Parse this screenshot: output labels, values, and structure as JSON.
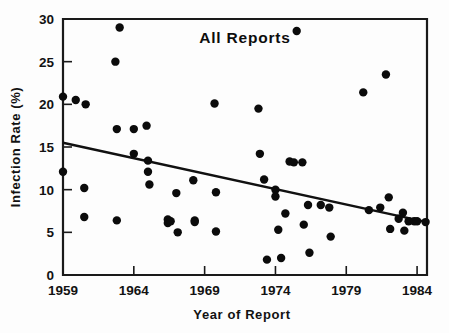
{
  "chart_data": {
    "type": "scatter",
    "title": "All Reports",
    "xlabel": "Year of Report",
    "ylabel": "Infection Rate (%)",
    "xlim": [
      1959,
      1984.7
    ],
    "ylim": [
      0,
      30
    ],
    "grid": false,
    "legend": "none",
    "xticks": [
      1959,
      1964,
      1969,
      1974,
      1979,
      1984
    ],
    "xtick_labels": [
      "1959",
      "1964",
      "1969",
      "1974",
      "1979",
      "1984"
    ],
    "yticks": [
      0,
      5,
      10,
      15,
      20,
      25,
      30
    ],
    "ytick_labels": [
      "0",
      "5",
      "10",
      "15",
      "20",
      "25",
      "30"
    ],
    "x": [
      1959.0,
      1959.0,
      1959.9,
      1960.6,
      1960.5,
      1960.5,
      1962.7,
      1962.8,
      1962.8,
      1963.0,
      1964.0,
      1964.0,
      1964.9,
      1965.0,
      1965.0,
      1965.1,
      1966.4,
      1966.4,
      1966.6,
      1967.0,
      1967.1,
      1968.2,
      1968.3,
      1968.3,
      1969.7,
      1969.8,
      1969.8,
      1972.8,
      1972.9,
      1973.2,
      1973.4,
      1974.0,
      1974.0,
      1974.2,
      1974.4,
      1974.7,
      1975.0,
      1975.3,
      1975.5,
      1975.9,
      1976.0,
      1976.3,
      1976.4,
      1977.2,
      1977.8,
      1977.9,
      1980.2,
      1980.6,
      1981.4,
      1981.8,
      1982.0,
      1982.1,
      1982.7,
      1983.0,
      1983.1,
      1983.4,
      1983.8,
      1984.0,
      1984.6
    ],
    "y": [
      20.9,
      12.1,
      20.5,
      20.0,
      10.2,
      6.8,
      25.0,
      17.1,
      6.4,
      29.0,
      17.1,
      14.2,
      17.5,
      13.4,
      12.1,
      10.6,
      6.5,
      6.1,
      6.3,
      9.6,
      5.0,
      11.1,
      6.4,
      6.2,
      20.1,
      9.7,
      5.1,
      19.5,
      14.2,
      11.2,
      1.8,
      9.2,
      10.0,
      5.3,
      2.0,
      7.2,
      13.3,
      13.2,
      28.6,
      13.2,
      5.9,
      8.2,
      2.6,
      8.2,
      7.9,
      4.5,
      21.4,
      7.6,
      7.9,
      23.5,
      9.1,
      5.4,
      6.6,
      7.3,
      5.2,
      6.3,
      6.3,
      6.3,
      6.2
    ],
    "trend_line": {
      "x": [
        1959.0,
        1984.7
      ],
      "y": [
        15.5,
        6.2
      ],
      "description": "downward linear regression fit"
    },
    "marker": {
      "shape": "circle",
      "color": "#0b0b0b",
      "size_px": 4.2
    },
    "point_count": 59
  },
  "style": {
    "axis_color": "#1a1a1a",
    "background": "#fdfdfd",
    "text_color": "#121212"
  }
}
